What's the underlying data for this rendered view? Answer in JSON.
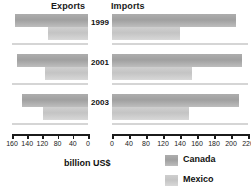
{
  "headers": {
    "exports": "Exports",
    "imports": "Imports"
  },
  "axis_title": "billion US$",
  "years": [
    "1999",
    "2001",
    "2003"
  ],
  "legend": {
    "position": "bottom-right",
    "items": [
      {
        "label": "Canada",
        "color": "#a8a8a8",
        "key": "canada"
      },
      {
        "label": "Mexico",
        "color": "#cbcbcb",
        "key": "mexico"
      }
    ]
  },
  "left_axis": {
    "label": "billion US$",
    "direction": "reversed",
    "tick_labels": [
      "160",
      "140",
      "120",
      "80",
      "40",
      "0"
    ],
    "max": 160
  },
  "right_axis": {
    "label": "billion US$",
    "direction": "normal",
    "tick_labels": [
      "0",
      "40",
      "80",
      "120",
      "140",
      "160",
      "180",
      "200",
      "220"
    ],
    "max": 220
  },
  "chart_data": {
    "type": "bar",
    "orientation": "horizontal",
    "layout": "back-to-back butterfly (two panels sharing year categories)",
    "title": "",
    "xlabel": "billion US$",
    "ylabel": "",
    "grid": false,
    "categories": [
      "1999",
      "2001",
      "2003"
    ],
    "panels": [
      {
        "name": "Exports",
        "side": "left",
        "xlim": [
          0,
          160
        ],
        "axis_reversed": true,
        "tick_labels": [
          "160",
          "140",
          "120",
          "80",
          "40",
          "0"
        ],
        "series": [
          {
            "name": "Canada",
            "values": [
              154,
              150,
              140
            ]
          },
          {
            "name": "Mexico",
            "values": [
              85,
              90,
              95
            ]
          }
        ]
      },
      {
        "name": "Imports",
        "side": "right",
        "xlim": [
          0,
          220
        ],
        "axis_reversed": false,
        "tick_labels": [
          "0",
          "40",
          "80",
          "120",
          "140",
          "160",
          "180",
          "200",
          "220"
        ],
        "series": [
          {
            "name": "Canada",
            "values": [
              200,
              210,
              205
            ]
          },
          {
            "name": "Mexico",
            "values": [
              110,
              130,
              125
            ]
          }
        ]
      }
    ]
  }
}
